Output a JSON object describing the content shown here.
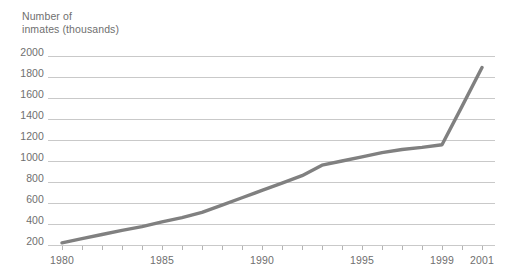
{
  "chart_data": {
    "type": "line",
    "title_line1": "Number of",
    "title_line2": "inmates (thousands)",
    "xlabel": "",
    "ylabel": "Number of inmates (thousands)",
    "ylim": [
      0,
      2000
    ],
    "xlim": [
      1980,
      2001
    ],
    "grid": true,
    "legend": "none",
    "line_color": "#808080",
    "grid_color": "#c9c9c9",
    "text_color": "#6f6f6f",
    "background_color": "#ffffff",
    "yticks": [
      2000,
      1800,
      1600,
      1400,
      1200,
      1000,
      800,
      600,
      400,
      200
    ],
    "ytick_labels": [
      "2000",
      "1800",
      "1600",
      "1400",
      "1200",
      "1000",
      "800",
      "600",
      "400",
      "200"
    ],
    "xticks": [
      1980,
      1981,
      1982,
      1983,
      1984,
      1985,
      1986,
      1987,
      1988,
      1989,
      1990,
      1991,
      1992,
      1993,
      1994,
      1995,
      1996,
      1997,
      1998,
      1999,
      2000,
      2001
    ],
    "xtick_labels_shown": [
      "1980",
      "1985",
      "1990",
      "1995",
      "1999",
      "2001"
    ],
    "xtick_labels_shown_years": [
      1980,
      1985,
      1990,
      1995,
      1999,
      2001
    ],
    "x": [
      1980,
      1981,
      1982,
      1983,
      1984,
      1985,
      1986,
      1987,
      1988,
      1989,
      1990,
      1991,
      1992,
      1993,
      1994,
      1995,
      1996,
      1997,
      1998,
      1999,
      2000,
      2001
    ],
    "values": [
      220,
      260,
      300,
      340,
      375,
      420,
      460,
      510,
      580,
      650,
      720,
      790,
      860,
      960,
      1000,
      1040,
      1080,
      1110,
      1130,
      1155,
      1520,
      1890
    ],
    "series": [
      {
        "name": "Number of inmates (thousands)",
        "values": [
          220,
          260,
          300,
          340,
          375,
          420,
          460,
          510,
          580,
          650,
          720,
          790,
          860,
          960,
          1000,
          1040,
          1080,
          1110,
          1130,
          1155,
          1520,
          1890
        ]
      }
    ]
  }
}
